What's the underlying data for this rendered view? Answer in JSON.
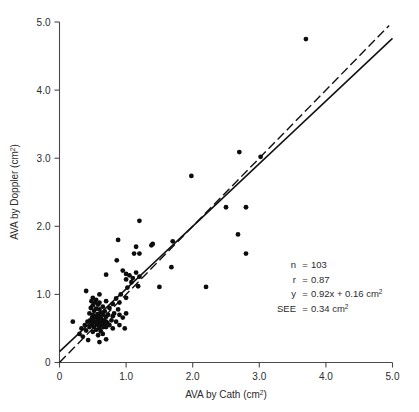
{
  "figure": {
    "name": "ava-doppler-vs-cath-scatter"
  },
  "chart_data": {
    "type": "scatter",
    "title": "",
    "xlabel": "AVA by Cath (cm2)",
    "xlabel_base": "AVA by Cath (cm",
    "xlabel_sup": "2",
    "xlabel_tail": ")",
    "ylabel": "AVA by Doppler (cm2)",
    "ylabel_base": "AVA by Doppler (cm",
    "ylabel_sup": "2",
    "ylabel_tail": ")",
    "xlim": [
      0,
      5.0
    ],
    "ylim": [
      0,
      5.0
    ],
    "grid": false,
    "legend": "none",
    "xticks": [
      0,
      1.0,
      2.0,
      3.0,
      4.0,
      5.0
    ],
    "xtick_labels": [
      "0",
      "1.0",
      "2.0",
      "3.0",
      "4.0",
      "5.0"
    ],
    "yticks": [
      0,
      1.0,
      2.0,
      3.0,
      4.0,
      5.0
    ],
    "ytick_labels": [
      "0",
      "1.0",
      "2.0",
      "3.0",
      "4.0",
      "5.0"
    ],
    "marker_color": "#0d0d0d",
    "marker_size": 2.4,
    "lines": [
      {
        "name": "regression-line",
        "style": "solid",
        "slope": 0.92,
        "intercept": 0.16,
        "x_from": 0.0,
        "x_to": 5.0,
        "color": "#111111"
      },
      {
        "name": "identity-line",
        "style": "dashed",
        "slope": 1.0,
        "intercept": 0.0,
        "x_from": 0.0,
        "x_to": 4.95,
        "color": "#111111"
      }
    ],
    "points": [
      [
        0.2,
        0.6
      ],
      [
        0.3,
        0.42
      ],
      [
        0.33,
        0.5
      ],
      [
        0.35,
        0.38
      ],
      [
        0.38,
        0.55
      ],
      [
        0.4,
        0.47
      ],
      [
        0.4,
        1.05
      ],
      [
        0.42,
        0.6
      ],
      [
        0.43,
        0.33
      ],
      [
        0.45,
        0.52
      ],
      [
        0.45,
        0.72
      ],
      [
        0.46,
        0.62
      ],
      [
        0.47,
        0.8
      ],
      [
        0.48,
        0.55
      ],
      [
        0.48,
        0.9
      ],
      [
        0.49,
        0.66
      ],
      [
        0.5,
        0.45
      ],
      [
        0.5,
        0.58
      ],
      [
        0.5,
        0.7
      ],
      [
        0.5,
        0.84
      ],
      [
        0.5,
        0.95
      ],
      [
        0.51,
        0.62
      ],
      [
        0.52,
        0.52
      ],
      [
        0.52,
        0.76
      ],
      [
        0.53,
        0.88
      ],
      [
        0.54,
        0.6
      ],
      [
        0.55,
        0.48
      ],
      [
        0.55,
        0.67
      ],
      [
        0.55,
        0.79
      ],
      [
        0.55,
        0.92
      ],
      [
        0.56,
        0.56
      ],
      [
        0.57,
        0.71
      ],
      [
        0.58,
        0.4
      ],
      [
        0.58,
        0.63
      ],
      [
        0.58,
        0.85
      ],
      [
        0.59,
        0.54
      ],
      [
        0.6,
        0.3
      ],
      [
        0.6,
        0.5
      ],
      [
        0.6,
        0.6
      ],
      [
        0.6,
        0.68
      ],
      [
        0.6,
        0.78
      ],
      [
        0.6,
        0.88
      ],
      [
        0.6,
        1.0
      ],
      [
        0.61,
        0.58
      ],
      [
        0.62,
        0.46
      ],
      [
        0.62,
        0.73
      ],
      [
        0.63,
        0.64
      ],
      [
        0.64,
        0.55
      ],
      [
        0.65,
        0.42
      ],
      [
        0.65,
        0.6
      ],
      [
        0.65,
        0.7
      ],
      [
        0.65,
        0.82
      ],
      [
        0.66,
        0.52
      ],
      [
        0.67,
        0.62
      ],
      [
        0.68,
        0.56
      ],
      [
        0.68,
        0.75
      ],
      [
        0.7,
        0.34
      ],
      [
        0.7,
        0.52
      ],
      [
        0.7,
        0.6
      ],
      [
        0.7,
        0.67
      ],
      [
        0.7,
        0.9
      ],
      [
        0.7,
        1.29
      ],
      [
        0.72,
        0.58
      ],
      [
        0.73,
        0.7
      ],
      [
        0.75,
        0.55
      ],
      [
        0.75,
        0.8
      ],
      [
        0.78,
        0.62
      ],
      [
        0.8,
        0.5
      ],
      [
        0.8,
        0.68
      ],
      [
        0.8,
        0.86
      ],
      [
        0.82,
        0.72
      ],
      [
        0.85,
        0.6
      ],
      [
        0.85,
        0.94
      ],
      [
        0.86,
        1.5
      ],
      [
        0.88,
        0.78
      ],
      [
        0.88,
        1.8
      ],
      [
        0.9,
        0.55
      ],
      [
        0.9,
        0.7
      ],
      [
        0.9,
        0.88
      ],
      [
        0.92,
        1.0
      ],
      [
        0.95,
        0.66
      ],
      [
        0.95,
        1.35
      ],
      [
        0.98,
        0.5
      ],
      [
        1.0,
        0.72
      ],
      [
        1.0,
        0.95
      ],
      [
        1.0,
        1.22
      ],
      [
        1.0,
        1.3
      ],
      [
        1.02,
        1.1
      ],
      [
        1.05,
        1.28
      ],
      [
        1.08,
        1.18
      ],
      [
        1.1,
        1.24
      ],
      [
        1.12,
        1.6
      ],
      [
        1.15,
        1.32
      ],
      [
        1.15,
        1.7
      ],
      [
        1.18,
        1.12
      ],
      [
        1.2,
        1.26
      ],
      [
        1.2,
        1.6
      ],
      [
        1.2,
        2.08
      ],
      [
        1.38,
        1.72
      ],
      [
        1.4,
        1.74
      ],
      [
        1.5,
        1.11
      ],
      [
        1.68,
        1.4
      ],
      [
        1.7,
        1.78
      ],
      [
        1.98,
        2.74
      ],
      [
        2.2,
        1.11
      ],
      [
        2.5,
        2.28
      ],
      [
        2.68,
        1.88
      ],
      [
        2.7,
        3.09
      ],
      [
        2.8,
        1.6
      ],
      [
        2.8,
        2.28
      ],
      [
        3.02,
        3.02
      ],
      [
        3.7,
        4.75
      ]
    ],
    "annotations": [
      {
        "label": "n",
        "eq": "=",
        "value": "103",
        "unit": "",
        "unit_sup": ""
      },
      {
        "label": "r",
        "eq": "=",
        "value": "0.87",
        "unit": "",
        "unit_sup": ""
      },
      {
        "label": "y",
        "eq": "=",
        "value": "0.92x  +  0.16 cm",
        "unit": "",
        "unit_sup": "2"
      },
      {
        "label": "SEE",
        "eq": "=",
        "value": "0.34 cm",
        "unit": "",
        "unit_sup": "2"
      }
    ]
  }
}
